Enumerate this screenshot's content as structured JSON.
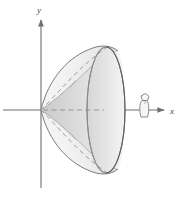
{
  "figure": {
    "kind": "math-3d-surface-diagram",
    "background_color": "#ffffff"
  },
  "axes": {
    "x_axis": {
      "label": "x",
      "label_x": 172,
      "label_y": 112,
      "line_y": 110,
      "line_x_start": 3,
      "line_x_end": 163,
      "arrow": true
    },
    "y_axis": {
      "label": "y",
      "label_x": 40,
      "label_y": 10,
      "line_x": 41,
      "line_y_start": 186,
      "line_y_end": 18,
      "arrow": true
    },
    "origin": {
      "x": 41,
      "y": 110
    },
    "axis_color": "#6e6e6e"
  },
  "surface": {
    "name": "paraboloid",
    "vertex": {
      "x": 41,
      "y": 110
    },
    "rim_center": {
      "x": 106,
      "y": 110
    },
    "rim_radius_x": 19,
    "rim_radius_y": 64,
    "outline_color": "#6a6a6a",
    "fill_light": "#f2f2f2",
    "fill_mid": "#e4e4e4",
    "fill_dark": "#d2d2d2",
    "hidden_edge_style": "dashed",
    "hidden_edge_color": "#8c8c8c"
  },
  "observer": {
    "name": "viewer-icon",
    "x": 144,
    "y": 104,
    "color": "#7d7d7d",
    "description": "small observer figure standing on the x-axis looking toward the surface"
  }
}
